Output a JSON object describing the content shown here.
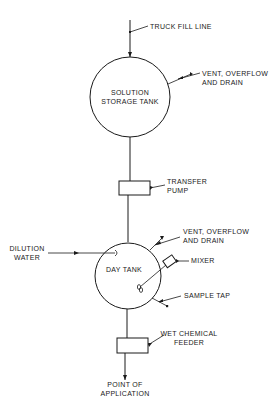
{
  "diagram": {
    "type": "process-flow",
    "colors": {
      "line": "#1a1a1a",
      "background": "#ffffff"
    },
    "labels": {
      "truck_fill_line": "TRUCK FILL LINE",
      "storage_tank_line1": "SOLUTION",
      "storage_tank_line2": "STORAGE TANK",
      "storage_vent_line1": "VENT, OVERFLOW",
      "storage_vent_line2": "AND DRAIN",
      "transfer_pump_line1": "TRANSFER",
      "transfer_pump_line2": "PUMP",
      "dilution_water_line1": "DILUTION",
      "dilution_water_line2": "WATER",
      "day_tank": "DAY TANK",
      "day_vent_line1": "VENT, OVERFLOW",
      "day_vent_line2": "AND DRAIN",
      "mixer": "MIXER",
      "sample_tap": "SAMPLE TAP",
      "feeder_line1": "WET CHEMICAL",
      "feeder_line2": "FEEDER",
      "application_line1": "POINT OF",
      "application_line2": "APPLICATION"
    },
    "nodes": [
      {
        "id": "solution-storage-tank",
        "shape": "circle"
      },
      {
        "id": "transfer-pump",
        "shape": "rectangle"
      },
      {
        "id": "day-tank",
        "shape": "circle"
      },
      {
        "id": "wet-chemical-feeder",
        "shape": "rectangle"
      }
    ],
    "flow": [
      "truck-fill-line",
      "solution-storage-tank",
      "transfer-pump",
      "day-tank",
      "wet-chemical-feeder",
      "point-of-application"
    ]
  }
}
